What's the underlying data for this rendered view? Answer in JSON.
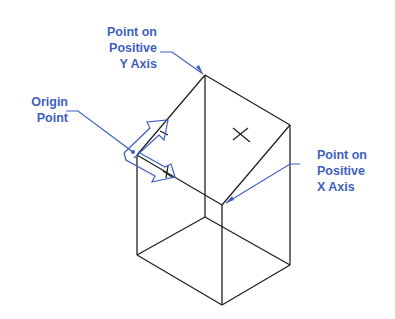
{
  "labels": {
    "y_axis": [
      "Point on",
      "Positive",
      "Y Axis"
    ],
    "origin": [
      "Origin",
      "Point"
    ],
    "x_axis": [
      "Point on",
      "Positive",
      "X Axis"
    ]
  },
  "colors": {
    "annotation": "#3f5fbf",
    "lines": "#222222"
  }
}
